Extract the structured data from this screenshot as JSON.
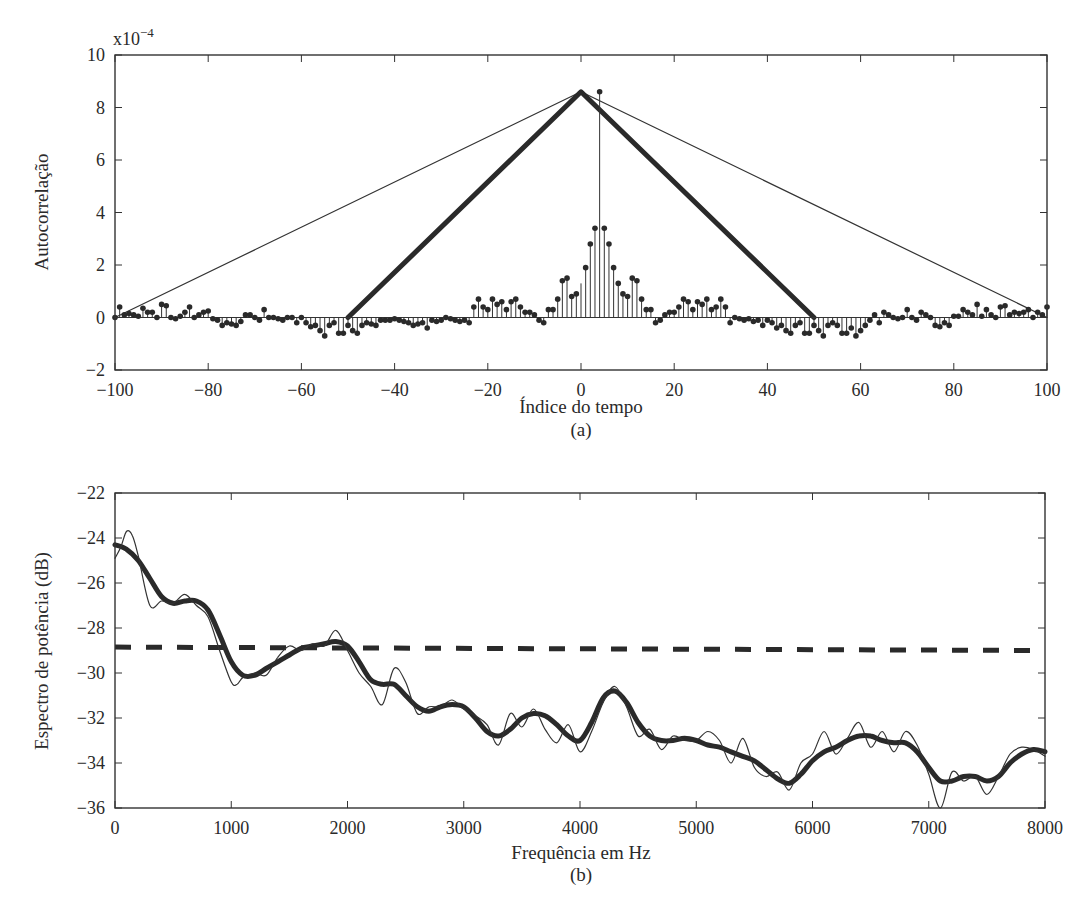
{
  "chart_data": [
    {
      "type": "line",
      "panel": "(a)",
      "title": "",
      "xlabel": "Índice do tempo",
      "ylabel": "Autocorrelação",
      "y_multiplier": "x10^-4",
      "y_multiplier_base": "x10",
      "y_multiplier_exp": "−4",
      "caption": "(a)",
      "xlim": [
        -100,
        100
      ],
      "ylim": [
        -2,
        10
      ],
      "xticks": [
        -100,
        -80,
        -60,
        -40,
        -20,
        0,
        20,
        40,
        60,
        80,
        100
      ],
      "xtick_labels": [
        "−100",
        "−80",
        "−60",
        "−40",
        "−20",
        "0",
        "20",
        "40",
        "60",
        "80",
        "100"
      ],
      "yticks": [
        -2,
        0,
        2,
        4,
        6,
        8,
        10
      ],
      "ytick_labels": [
        "−2",
        "0",
        "2",
        "4",
        "6",
        "8",
        "10"
      ],
      "grid": false,
      "legend": null,
      "series": [
        {
          "name": "Janela triangular longa (Bartlett, L=100)",
          "style": "thin-line",
          "x": [
            -100,
            0,
            100
          ],
          "y": [
            0,
            8.6,
            0
          ]
        },
        {
          "name": "Janela triangular curta (Bartlett, L=50)",
          "style": "thick-line",
          "x": [
            -50,
            0,
            50
          ],
          "y": [
            0,
            8.6,
            0
          ]
        },
        {
          "name": "Autocorrelação estimada",
          "style": "stem",
          "x": [
            -100,
            -99,
            -98,
            -97,
            -96,
            -95,
            -94,
            -93,
            -92,
            -91,
            -90,
            -89,
            -88,
            -87,
            -86,
            -85,
            -84,
            -83,
            -82,
            -81,
            -80,
            -79,
            -78,
            -77,
            -76,
            -75,
            -74,
            -73,
            -72,
            -71,
            -70,
            -69,
            -68,
            -67,
            -66,
            -65,
            -64,
            -63,
            -62,
            -61,
            -60,
            -59,
            -58,
            -57,
            -56,
            -55,
            -54,
            -53,
            -52,
            -51,
            -50,
            -49,
            -48,
            -47,
            -46,
            -45,
            -44,
            -43,
            -42,
            -41,
            -40,
            -39,
            -38,
            -37,
            -36,
            -35,
            -34,
            -33,
            -32,
            -31,
            -30,
            -29,
            -28,
            -27,
            -26,
            -25,
            -24,
            -23,
            -22,
            -21,
            -20,
            -19,
            -18,
            -17,
            -16,
            -15,
            -14,
            -13,
            -12,
            -11,
            -10,
            -9,
            -8,
            -7,
            -6,
            -5,
            -4,
            -3,
            -2,
            -1,
            0,
            1,
            2,
            3,
            4,
            5,
            6,
            7,
            8,
            9,
            10,
            11,
            12,
            13,
            14,
            15,
            16,
            17,
            18,
            19,
            20,
            21,
            22,
            23,
            24,
            25,
            26,
            27,
            28,
            29,
            30,
            31,
            32,
            33,
            34,
            35,
            36,
            37,
            38,
            39,
            40,
            41,
            42,
            43,
            44,
            45,
            46,
            47,
            48,
            49,
            50,
            51,
            52,
            53,
            54,
            55,
            56,
            57,
            58,
            59,
            60,
            61,
            62,
            63,
            64,
            65,
            66,
            67,
            68,
            69,
            70,
            71,
            72,
            73,
            74,
            75,
            76,
            77,
            78,
            79,
            80,
            81,
            82,
            83,
            84,
            85,
            86,
            87,
            88,
            89,
            90,
            91,
            92,
            93,
            94,
            95,
            96,
            97,
            98,
            99,
            100
          ],
          "y": [
            0,
            0.4,
            0.1,
            0.15,
            0.1,
            0.05,
            0.35,
            0.2,
            0.2,
            0,
            0.5,
            0.45,
            0,
            -0.05,
            0.05,
            0.2,
            0.4,
            0,
            0.1,
            0.2,
            0.25,
            -0.05,
            -0.1,
            -0.3,
            -0.2,
            -0.25,
            -0.3,
            -0.15,
            0.1,
            0.1,
            0,
            -0.1,
            0.3,
            0,
            0,
            -0.05,
            -0.1,
            0,
            0,
            -0.2,
            0,
            -0.2,
            -0.35,
            -0.3,
            -0.5,
            -0.7,
            -0.3,
            -0.2,
            -0.6,
            -0.6,
            -0.3,
            -0.5,
            -0.6,
            -0.3,
            -0.2,
            -0.25,
            -0.3,
            -0.1,
            -0.1,
            -0.1,
            -0.05,
            -0.1,
            -0.15,
            -0.2,
            -0.3,
            -0.25,
            -0.2,
            -0.4,
            -0.1,
            -0.15,
            -0.1,
            0,
            -0.05,
            -0.1,
            -0.15,
            -0.1,
            -0.2,
            0.4,
            0.7,
            0.4,
            0.3,
            0.7,
            0.5,
            0.6,
            0.3,
            0.6,
            0.7,
            0.4,
            0.2,
            0.2,
            0.1,
            -0.1,
            -0.2,
            0.3,
            0.3,
            0.7,
            1.4,
            1.5,
            0.8,
            0.9,
            1.3,
            1.9,
            2.8,
            3.4,
            8.6,
            3.4,
            2.8,
            1.9,
            1.3,
            0.9,
            0.8,
            1.5,
            1.4,
            0.7,
            0.3,
            0.3,
            -0.2,
            -0.1,
            0.1,
            0.2,
            0.2,
            0.4,
            0.7,
            0.6,
            0.3,
            0.6,
            0.5,
            0.7,
            0.3,
            0.4,
            0.7,
            0.4,
            -0.2,
            0,
            -0.05,
            -0.1,
            -0.05,
            -0.15,
            -0.1,
            -0.3,
            -0.1,
            -0.2,
            -0.4,
            -0.3,
            -0.5,
            -0.6,
            -0.3,
            -0.2,
            -0.6,
            -0.6,
            -0.3,
            -0.5,
            -0.7,
            -0.3,
            -0.2,
            -0.3,
            -0.6,
            -0.6,
            -0.4,
            -0.7,
            -0.5,
            -0.3,
            -0.1,
            0.1,
            -0.2,
            0.2,
            0.1,
            0,
            -0.05,
            0,
            0.3,
            0,
            -0.1,
            0.2,
            0.1,
            0,
            -0.3,
            -0.35,
            -0.2,
            -0.3,
            0.05,
            0.05,
            0.3,
            0.2,
            0.1,
            0.5,
            0.05,
            0.3,
            0.1,
            0,
            0.4,
            0.45,
            0.1,
            0.2,
            0.15,
            0.2,
            0.3,
            0,
            0.2,
            0.1,
            0.4,
            0
          ]
        }
      ]
    },
    {
      "type": "line",
      "panel": "(b)",
      "title": "",
      "xlabel": "Frequência em Hz",
      "ylabel": "Espectro de potência (dB)",
      "caption": "(b)",
      "xlim": [
        0,
        8000
      ],
      "ylim": [
        -36,
        -22
      ],
      "xticks": [
        0,
        1000,
        2000,
        3000,
        4000,
        5000,
        6000,
        7000,
        8000
      ],
      "xtick_labels": [
        "0",
        "1000",
        "2000",
        "3000",
        "4000",
        "5000",
        "6000",
        "7000",
        "8000"
      ],
      "yticks": [
        -36,
        -34,
        -32,
        -30,
        -28,
        -26,
        -24,
        -22
      ],
      "ytick_labels": [
        "−36",
        "−34",
        "−32",
        "−30",
        "−28",
        "−26",
        "−24",
        "−22"
      ],
      "grid": false,
      "legend": null,
      "series": [
        {
          "name": "Espectro médio (tracejado)",
          "style": "dashed-thick",
          "x": [
            0,
            8000
          ],
          "y": [
            -28.85,
            -29.0
          ]
        },
        {
          "name": "Espectro suavizado (janela curta)",
          "style": "thick-line",
          "x": [
            0,
            100,
            200,
            300,
            400,
            500,
            600,
            700,
            800,
            900,
            1000,
            1100,
            1200,
            1300,
            1400,
            1500,
            1600,
            1700,
            1800,
            1900,
            2000,
            2100,
            2200,
            2300,
            2400,
            2500,
            2600,
            2700,
            2800,
            2900,
            3000,
            3100,
            3200,
            3300,
            3400,
            3500,
            3600,
            3700,
            3800,
            3900,
            4000,
            4100,
            4200,
            4300,
            4400,
            4500,
            4600,
            4700,
            4800,
            4900,
            5000,
            5100,
            5200,
            5300,
            5400,
            5500,
            5600,
            5700,
            5800,
            5900,
            6000,
            6100,
            6200,
            6300,
            6400,
            6500,
            6600,
            6700,
            6800,
            6900,
            7000,
            7100,
            7200,
            7300,
            7400,
            7500,
            7600,
            7700,
            7800,
            7900,
            8000
          ],
          "y": [
            -24.3,
            -24.5,
            -25.0,
            -25.8,
            -26.6,
            -26.9,
            -26.8,
            -26.8,
            -27.2,
            -28.3,
            -29.5,
            -30.1,
            -30.1,
            -29.8,
            -29.5,
            -29.2,
            -28.9,
            -28.8,
            -28.7,
            -28.6,
            -28.8,
            -29.5,
            -30.3,
            -30.5,
            -30.5,
            -31.0,
            -31.5,
            -31.7,
            -31.5,
            -31.4,
            -31.5,
            -32.0,
            -32.6,
            -32.8,
            -32.5,
            -32.0,
            -31.8,
            -31.9,
            -32.3,
            -32.8,
            -33.0,
            -32.2,
            -31.1,
            -30.8,
            -31.3,
            -32.2,
            -32.8,
            -33.0,
            -33.0,
            -32.9,
            -33.0,
            -33.2,
            -33.3,
            -33.5,
            -33.7,
            -33.9,
            -34.3,
            -34.7,
            -34.9,
            -34.5,
            -33.9,
            -33.5,
            -33.3,
            -33.0,
            -32.8,
            -32.8,
            -33.0,
            -33.1,
            -33.1,
            -33.5,
            -34.2,
            -34.8,
            -34.8,
            -34.6,
            -34.6,
            -34.8,
            -34.6,
            -34.0,
            -33.6,
            -33.4,
            -33.5
          ]
        },
        {
          "name": "Espectro (janela longa)",
          "style": "thin-line",
          "x": [
            0,
            50,
            100,
            150,
            200,
            300,
            400,
            500,
            600,
            700,
            800,
            900,
            1000,
            1050,
            1100,
            1200,
            1300,
            1400,
            1500,
            1600,
            1700,
            1800,
            1900,
            2000,
            2100,
            2200,
            2300,
            2400,
            2500,
            2600,
            2700,
            2800,
            2900,
            3000,
            3100,
            3200,
            3300,
            3400,
            3500,
            3600,
            3700,
            3800,
            3900,
            4000,
            4100,
            4200,
            4300,
            4400,
            4500,
            4600,
            4700,
            4800,
            4900,
            5000,
            5100,
            5200,
            5300,
            5400,
            5500,
            5600,
            5700,
            5800,
            5900,
            6000,
            6100,
            6200,
            6300,
            6400,
            6500,
            6600,
            6700,
            6800,
            6900,
            7000,
            7100,
            7200,
            7300,
            7400,
            7500,
            7600,
            7700,
            7800,
            7900,
            8000
          ],
          "y": [
            -24.9,
            -24.4,
            -23.7,
            -23.9,
            -24.8,
            -27.0,
            -26.8,
            -26.9,
            -26.5,
            -27.0,
            -27.5,
            -29.0,
            -30.4,
            -30.5,
            -30.2,
            -30.0,
            -30.1,
            -29.3,
            -28.8,
            -29.0,
            -28.7,
            -28.8,
            -28.1,
            -29.0,
            -30.0,
            -30.6,
            -31.4,
            -29.8,
            -30.4,
            -31.8,
            -31.5,
            -31.5,
            -31.2,
            -31.6,
            -31.9,
            -32.3,
            -33.2,
            -31.8,
            -32.4,
            -31.6,
            -32.5,
            -33.1,
            -32.3,
            -33.5,
            -32.6,
            -31.3,
            -30.6,
            -31.5,
            -32.8,
            -32.5,
            -33.4,
            -32.8,
            -33.0,
            -33.0,
            -32.6,
            -33.0,
            -34.0,
            -32.9,
            -34.2,
            -34.6,
            -34.4,
            -35.2,
            -34.0,
            -33.6,
            -32.6,
            -33.6,
            -32.9,
            -32.2,
            -33.3,
            -32.6,
            -33.5,
            -32.6,
            -33.2,
            -34.5,
            -36.0,
            -34.4,
            -34.8,
            -34.6,
            -35.4,
            -34.6,
            -33.6,
            -33.3,
            -33.4,
            -33.7
          ]
        }
      ]
    }
  ]
}
